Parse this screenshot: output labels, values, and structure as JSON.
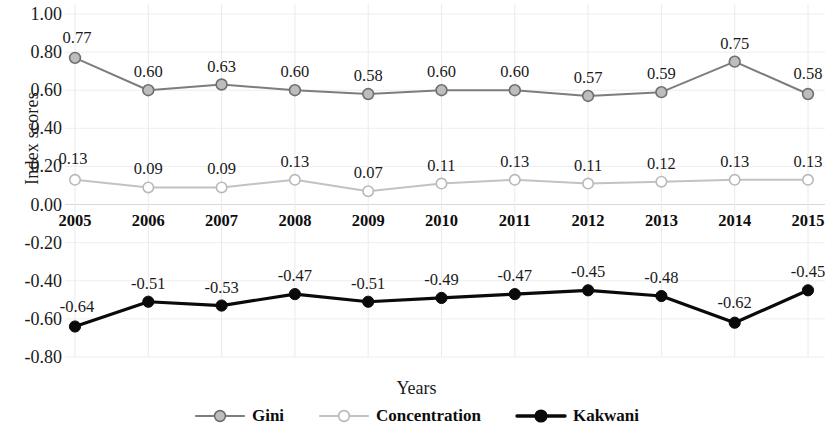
{
  "chart_data": {
    "type": "line",
    "title": "",
    "xlabel": "Years",
    "ylabel": "Index scores",
    "categories": [
      "2005",
      "2006",
      "2007",
      "2008",
      "2009",
      "2010",
      "2011",
      "2012",
      "2013",
      "2014",
      "2015"
    ],
    "ylim": [
      -0.8,
      1.0
    ],
    "ytick_labels": [
      "1.00",
      "0.80",
      "0.60",
      "0.40",
      "0.20",
      "0.00",
      "-0.20",
      "-0.40",
      "-0.60",
      "-0.80"
    ],
    "ytick_values": [
      1.0,
      0.8,
      0.6,
      0.4,
      0.2,
      0.0,
      -0.2,
      -0.4,
      -0.6,
      -0.8
    ],
    "grid": true,
    "legend_position": "bottom",
    "series": [
      {
        "name": "Gini",
        "color": "#7d7d7d",
        "marker": "filled-gray-circle",
        "values": [
          0.77,
          0.6,
          0.63,
          0.6,
          0.58,
          0.6,
          0.6,
          0.57,
          0.59,
          0.75,
          0.58
        ],
        "labels": [
          "0.77",
          "0.60",
          "0.63",
          "0.60",
          "0.58",
          "0.60",
          "0.60",
          "0.57",
          "0.59",
          "0.75",
          "0.58"
        ]
      },
      {
        "name": "Concentration",
        "color": "#c2c2c2",
        "marker": "hollow-circle",
        "values": [
          0.13,
          0.09,
          0.09,
          0.13,
          0.07,
          0.11,
          0.13,
          0.11,
          0.12,
          0.13,
          0.13
        ],
        "labels": [
          "0.13",
          "0.09",
          "0.09",
          "0.13",
          "0.07",
          "0.11",
          "0.13",
          "0.11",
          "0.12",
          "0.13",
          "0.13"
        ]
      },
      {
        "name": "Kakwani",
        "color": "#0a0a0a",
        "marker": "filled-black-circle",
        "values": [
          -0.64,
          -0.51,
          -0.53,
          -0.47,
          -0.51,
          -0.49,
          -0.47,
          -0.45,
          -0.48,
          -0.62,
          -0.45
        ],
        "labels": [
          "-0.64",
          "-0.51",
          "-0.53",
          "-0.47",
          "-0.51",
          "-0.49",
          "-0.47",
          "-0.45",
          "-0.48",
          "-0.62",
          "-0.45"
        ]
      }
    ]
  },
  "legend": {
    "items": [
      {
        "label": "Gini"
      },
      {
        "label": "Concentration"
      },
      {
        "label": "Kakwani"
      }
    ]
  }
}
